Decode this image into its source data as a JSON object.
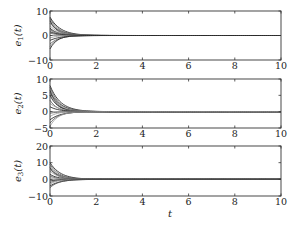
{
  "chart_data": [
    {
      "type": "line",
      "ylabel": "e1(t)",
      "xlabel": "",
      "xlim": [
        0,
        10
      ],
      "ylim": [
        -10,
        10
      ],
      "xticks": [
        "0",
        "2",
        "4",
        "6",
        "8",
        "10"
      ],
      "yticks": [
        "-10",
        "0",
        "10"
      ],
      "initial_values": [
        7.5,
        7,
        6.5,
        6,
        5,
        4,
        3,
        2.5,
        2,
        1.5,
        1,
        -1,
        -2,
        -3.5,
        -4.5,
        -5.5
      ],
      "description": "Multiple error trajectories starting between about -6 and 8, converging exponentially to 0 by t≈2 and remaining at 0 until t=10"
    },
    {
      "type": "line",
      "ylabel": "e2(t)",
      "xlabel": "",
      "xlim": [
        0,
        10
      ],
      "ylim": [
        -5,
        10
      ],
      "xticks": [
        "0",
        "2",
        "4",
        "6",
        "8",
        "10"
      ],
      "yticks": [
        "-5",
        "0",
        "5",
        "10"
      ],
      "initial_values": [
        8,
        7.5,
        7,
        6.5,
        6,
        5.5,
        5,
        3.5,
        2.5,
        1.5,
        -0.5,
        -1.5,
        -2.5,
        -3.5,
        -4.5
      ],
      "description": "Multiple error trajectories starting between about -4.5 and 8, converging to 0 by t≈2"
    },
    {
      "type": "line",
      "ylabel": "e3(t)",
      "xlabel": "t",
      "xlim": [
        0,
        10
      ],
      "ylim": [
        -10,
        20
      ],
      "xticks": [
        "0",
        "2",
        "4",
        "6",
        "8",
        "10"
      ],
      "yticks": [
        "-10",
        "0",
        "10",
        "20"
      ],
      "initial_values": [
        10,
        9,
        8,
        7,
        6,
        5,
        3,
        2,
        1,
        -1,
        -2,
        -3,
        -4,
        -5
      ],
      "description": "Multiple error trajectories starting between about -5 and 10, converging to 0 by t≈2"
    }
  ],
  "labels": {
    "p1_ylabel_main": "e",
    "p1_ylabel_sub": "1",
    "p1_ylabel_arg": "(t)",
    "p2_ylabel_main": "e",
    "p2_ylabel_sub": "2",
    "p2_ylabel_arg": "(t)",
    "p3_ylabel_main": "e",
    "p3_ylabel_sub": "3",
    "p3_ylabel_arg": "(t)",
    "xlabel": "t"
  }
}
